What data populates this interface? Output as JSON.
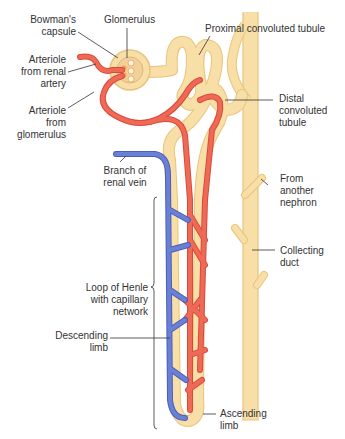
{
  "diagram": {
    "type": "anatomical-diagram",
    "subject": "nephron",
    "colors": {
      "tubule_fill": "#f8dfa8",
      "tubule_edge": "#e9c47c",
      "artery": "#ee6a57",
      "artery_edge": "#d94a3a",
      "vein": "#6a7fd6",
      "vein_edge": "#4b5fb8",
      "leader_line": "#333333",
      "text": "#333333"
    },
    "labels": {
      "bowmans_capsule": "Bowman's\ncapsule",
      "glomerulus": "Glomerulus",
      "proximal_convoluted_tubule": "Proximal convoluted tubule",
      "arteriole_from_renal_artery": "Arteriole\nfrom renal\nartery",
      "arteriole_from_glomerulus": "Arteriole\nfrom\nglomerulus",
      "distal_convoluted_tubule": "Distal\nconvoluted\ntubule",
      "branch_of_renal_vein": "Branch of\nrenal vein",
      "from_another_nephron": "From\nanother\nnephron",
      "collecting_duct": "Collecting\nduct",
      "loop_of_henle": "Loop of Henle\nwith capillary\nnetwork",
      "descending_limb": "Descending\nlimb",
      "ascending_limb": "Ascending\nlimb"
    }
  }
}
